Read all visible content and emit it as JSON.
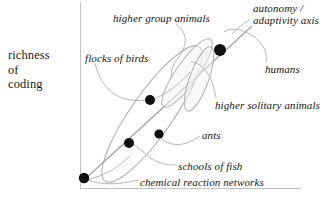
{
  "figure": {
    "kind": "conceptual-scatter-diagram",
    "background": "#ffffff",
    "ink_color": "#111111",
    "line_color": "#a9a9a9",
    "frame_color": "#bcbcbc"
  },
  "axes": {
    "y_label_lines": [
      "richness",
      "of",
      "coding"
    ],
    "y_label_text": "richness of coding",
    "diagonal_axis_lines": [
      "autonomy /",
      "adaptivity axis"
    ],
    "diagonal_axis_text": "autonomy / adaptivity axis"
  },
  "labels": [
    {
      "id": "higher-group-animals",
      "text": "higher group animals",
      "x": 113,
      "y": 13
    },
    {
      "id": "autonomy-adaptivity-axis-l1",
      "text": "autonomy /",
      "x": 252,
      "y": 4
    },
    {
      "id": "autonomy-adaptivity-axis-l2",
      "text": "adaptivity axis",
      "x": 252,
      "y": 16
    },
    {
      "id": "flocks-of-birds",
      "text": "flocks of birds",
      "x": 85,
      "y": 53
    },
    {
      "id": "humans",
      "text": "humans",
      "x": 265,
      "y": 64
    },
    {
      "id": "higher-solitary-animals",
      "text": "higher solitary animals",
      "x": 214,
      "y": 100
    },
    {
      "id": "ants",
      "text": "ants",
      "x": 203,
      "y": 131
    },
    {
      "id": "schools-of-fish",
      "text": "schools of fish",
      "x": 179,
      "y": 162
    },
    {
      "id": "chemical-reaction-networks",
      "text": "chemical reaction networks",
      "x": 141,
      "y": 178
    }
  ],
  "points": [
    {
      "id": "chemical-reaction-networks-point",
      "label": "chemical reaction networks",
      "cx": 84,
      "cy": 178,
      "r": 5.2
    },
    {
      "id": "schools-of-fish-point",
      "label": "schools of fish",
      "cx": 129,
      "cy": 143,
      "r": 5.0
    },
    {
      "id": "ants-point",
      "label": "ants",
      "cx": 159,
      "cy": 134,
      "r": 4.6
    },
    {
      "id": "flocks-of-birds-point",
      "label": "flocks of birds",
      "cx": 150,
      "cy": 100,
      "r": 5.0
    },
    {
      "id": "humans-point",
      "label": "humans",
      "cx": 220,
      "cy": 50,
      "r": 6.0
    }
  ],
  "groupings": [
    {
      "id": "outer-ellipse",
      "describes": "all systems",
      "cx": 152,
      "cy": 114,
      "rx": 82,
      "ry": 20,
      "rotate": -55
    },
    {
      "id": "group-animals-ellipse",
      "describes": "higher group animals",
      "cx": 187,
      "cy": 73,
      "rx": 40,
      "ry": 11,
      "rotate": -56
    },
    {
      "id": "solitary-animals-ellipse",
      "describes": "higher solitary animals",
      "cx": 200,
      "cy": 78,
      "rx": 34,
      "ry": 9,
      "rotate": -68
    }
  ],
  "frame": {
    "left_axis": {
      "x": 80,
      "y1": 2,
      "y2": 188
    },
    "bottom_axis": {
      "y": 188,
      "x1": 80,
      "x2": 300
    }
  }
}
